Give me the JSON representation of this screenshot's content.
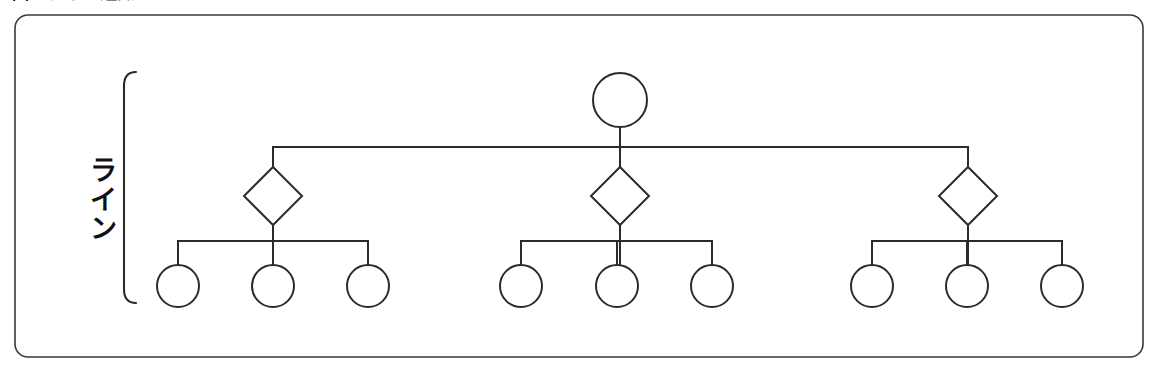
{
  "figure": {
    "caption": "図1 ライン組織",
    "group_label": "ライン",
    "border_color": "#3a3a3a",
    "line_color": "#2b2b2b",
    "node_fill": "#ffffff",
    "background": "#ffffff"
  },
  "diagram": {
    "type": "organization-chart",
    "root": {
      "shape": "circle",
      "label": "",
      "cx": 620,
      "cy": 100,
      "r": 27
    },
    "bus_y": 147,
    "middle_nodes": [
      {
        "shape": "diamond",
        "label": "",
        "cx": 273,
        "cy": 196,
        "r": 29
      },
      {
        "shape": "diamond",
        "label": "",
        "cx": 620,
        "cy": 196,
        "r": 29
      },
      {
        "shape": "diamond",
        "label": "",
        "cx": 968,
        "cy": 196,
        "r": 29
      }
    ],
    "leaf_bus_y": 241,
    "leaf_groups": [
      {
        "parent_cx": 273,
        "nodes": [
          {
            "shape": "circle",
            "label": "",
            "cx": 178,
            "cy": 286,
            "r": 21
          },
          {
            "shape": "circle",
            "label": "",
            "cx": 273,
            "cy": 286,
            "r": 21
          },
          {
            "shape": "circle",
            "label": "",
            "cx": 368,
            "cy": 286,
            "r": 21
          }
        ]
      },
      {
        "parent_cx": 620,
        "nodes": [
          {
            "shape": "circle",
            "label": "",
            "cx": 521,
            "cy": 286,
            "r": 21
          },
          {
            "shape": "circle",
            "label": "",
            "cx": 617,
            "cy": 286,
            "r": 21
          },
          {
            "shape": "circle",
            "label": "",
            "cx": 712,
            "cy": 286,
            "r": 21
          }
        ]
      },
      {
        "parent_cx": 968,
        "nodes": [
          {
            "shape": "circle",
            "label": "",
            "cx": 872,
            "cy": 286,
            "r": 21
          },
          {
            "shape": "circle",
            "label": "",
            "cx": 967,
            "cy": 286,
            "r": 21
          },
          {
            "shape": "circle",
            "label": "",
            "cx": 1062,
            "cy": 286,
            "r": 21
          }
        ]
      }
    ],
    "bracket": {
      "x": 124,
      "top": 72,
      "bottom": 303
    }
  }
}
